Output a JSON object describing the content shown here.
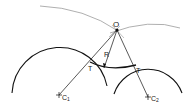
{
  "diagram": {
    "labels": {
      "center_point": "O",
      "radius": "R",
      "tangent_left": "T",
      "tangent_right": "T",
      "center1": "C",
      "center1_sub": "1",
      "center2": "C",
      "center2_sub": "2"
    },
    "colors": {
      "stroke": "#111111",
      "construction": "#999999",
      "background": "#ffffff"
    }
  }
}
